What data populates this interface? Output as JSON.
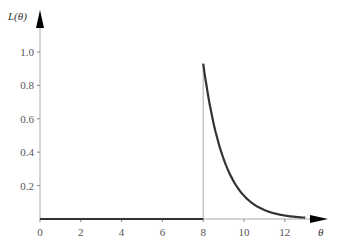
{
  "chart_data": {
    "type": "line",
    "title": "",
    "xlabel": "θ",
    "ylabel": "L(θ)",
    "xlim": [
      0,
      13
    ],
    "ylim": [
      0,
      1.0
    ],
    "grid": false,
    "x_ticks": [
      "0",
      "2",
      "4",
      "6",
      "8",
      "10",
      "12"
    ],
    "y_ticks": [
      "0.2",
      "0.4",
      "0.6",
      "0.8",
      "1.0"
    ],
    "series": [
      {
        "name": "L(θ)",
        "x": [
          0,
          8,
          8,
          8.5,
          9,
          9.5,
          10,
          10.5,
          11,
          11.5,
          12,
          12.5,
          13
        ],
        "values": [
          0,
          0,
          0.93,
          0.58,
          0.36,
          0.22,
          0.14,
          0.09,
          0.055,
          0.035,
          0.022,
          0.014,
          0.009
        ]
      }
    ],
    "annotations": [
      "vertical guide line at θ = 8"
    ]
  }
}
